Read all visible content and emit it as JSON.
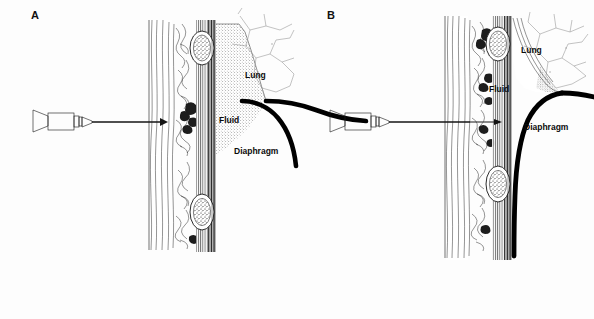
{
  "figure": {
    "background_color": "#fdfdfd",
    "ink_color": "#141414",
    "width": 594,
    "height": 319
  },
  "panels": [
    {
      "id": "A",
      "letter": "A",
      "description": "Large pleural fluid collection; needle enters above the diaphragm into a deep fluid layer",
      "fluid_size": "large",
      "labels": [
        {
          "name": "lung",
          "text": "Lung"
        },
        {
          "name": "fluid",
          "text": "Fluid"
        },
        {
          "name": "diaphragm",
          "text": "Diaphragm"
        }
      ],
      "structures": [
        "syringe",
        "needle",
        "skin",
        "subcutaneous-tissue",
        "intercostal-muscle",
        "rib-upper",
        "rib-lower",
        "pleura",
        "pleural-fluid",
        "lung",
        "diaphragm"
      ]
    },
    {
      "id": "B",
      "letter": "B",
      "description": "Small pleural fluid collection with elevated diaphragm; needle passes deeper through the chest wall",
      "fluid_size": "small",
      "labels": [
        {
          "name": "lung",
          "text": "Lung"
        },
        {
          "name": "fluid",
          "text": "Fluid"
        },
        {
          "name": "diaphragm",
          "text": "Diaphragm"
        }
      ],
      "structures": [
        "syringe",
        "needle",
        "skin",
        "subcutaneous-tissue",
        "intercostal-muscle",
        "rib-upper",
        "rib-lower",
        "pleura",
        "pleural-fluid",
        "lung",
        "diaphragm"
      ]
    }
  ]
}
